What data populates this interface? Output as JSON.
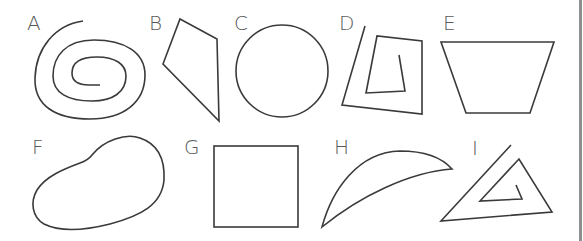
{
  "figure": {
    "type": "shape-identification",
    "stroke_color": "#3a3a3a",
    "label_color": "#5a5a5a",
    "shapes": [
      {
        "label": "A",
        "kind": "open spiral curve"
      },
      {
        "label": "B",
        "kind": "quadrilateral"
      },
      {
        "label": "C",
        "kind": "circle"
      },
      {
        "label": "D",
        "kind": "open spiral polyline (quadrilateral)"
      },
      {
        "label": "E",
        "kind": "trapezoid"
      },
      {
        "label": "F",
        "kind": "closed irregular curve"
      },
      {
        "label": "G",
        "kind": "square"
      },
      {
        "label": "H",
        "kind": "crescent"
      },
      {
        "label": "I",
        "kind": "open spiral polyline (triangle)"
      }
    ]
  }
}
